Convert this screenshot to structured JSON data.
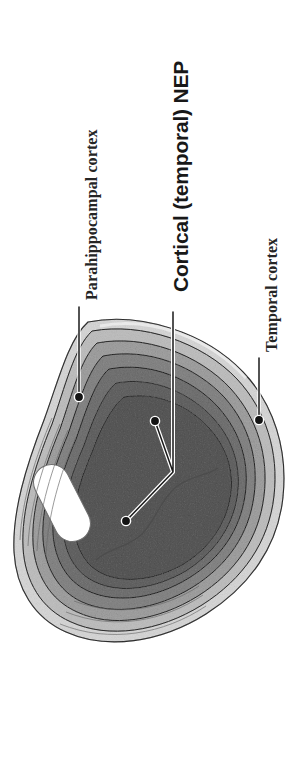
{
  "figure": {
    "background_color": "#ffffff",
    "width": 296,
    "height": 777
  },
  "labels": [
    {
      "id": "parahippocampal",
      "text": "Parahippocampal cortex",
      "style": "serif-bold",
      "rotation_deg": -90,
      "color": "#252525",
      "leader": {
        "from_x": 79,
        "from_y": 307,
        "to_x": 79,
        "to_y": 396,
        "dot_x": 79,
        "dot_y": 397
      }
    },
    {
      "id": "cortical-nep",
      "text": "Cortical (temporal) NEP",
      "style": "sans-bold",
      "rotation_deg": -90,
      "color": "#181818",
      "leader": {
        "trunk_x": 173,
        "trunk_top_y": 312,
        "trunk_bottom_y": 472,
        "branch_a_dot_x": 155,
        "branch_a_dot_y": 421,
        "branch_b_dot_x": 126,
        "branch_b_dot_y": 521
      }
    },
    {
      "id": "temporal",
      "text": "Temporal cortex",
      "style": "serif-bold",
      "rotation_deg": -90,
      "color": "#252525",
      "leader": {
        "from_x": 259,
        "from_y": 358,
        "to_x": 259,
        "to_y": 419,
        "dot_x": 259,
        "dot_y": 420
      }
    }
  ],
  "anatomy": {
    "section_type": "coronal-temporal-lobe",
    "structures": [
      {
        "name": "outer-pial-rim",
        "fill": "#e9e9e9"
      },
      {
        "name": "molecular-layer-band",
        "fill": "#d6d6d6"
      },
      {
        "name": "outer-cortical-band",
        "fill": "#c4c4c4"
      },
      {
        "name": "mid-cortical-band",
        "fill": "#b3b3b3"
      },
      {
        "name": "inner-cortical-band",
        "fill": "#a2a2a2"
      },
      {
        "name": "subcortical-core",
        "fill": "#969696"
      },
      {
        "name": "deep-core",
        "fill": "#8c8c8c"
      },
      {
        "name": "lateral-ventricle",
        "fill": "#ffffff"
      }
    ],
    "contour_color": "#585858",
    "dot_color": "#141414",
    "leader_line_color": "#1a1a1a"
  }
}
